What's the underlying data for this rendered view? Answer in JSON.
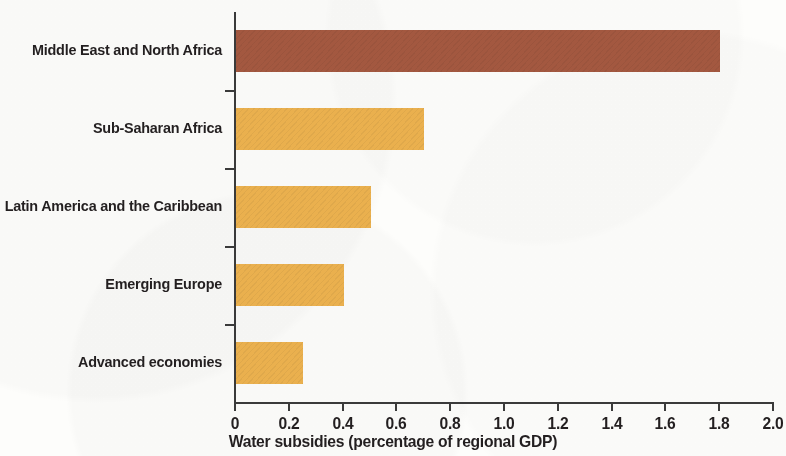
{
  "chart_data": {
    "type": "bar",
    "orientation": "horizontal",
    "title": "",
    "subtitle": "",
    "xlabel": "Water subsidies (percentage of regional GDP)",
    "ylabel": "",
    "categories": [
      "Middle East and North Africa",
      "Sub-Saharan Africa",
      "Latin America and the Caribbean",
      "Emerging Europe",
      "Advanced economies"
    ],
    "values": [
      1.8,
      0.7,
      0.5,
      0.4,
      0.25
    ],
    "bar_colors": [
      "#a35840",
      "#eab04e",
      "#eab04e",
      "#eab04e",
      "#eab04e"
    ],
    "xlim": [
      0,
      2.0
    ],
    "xticks": [
      0,
      0.2,
      0.4,
      0.6,
      0.8,
      1.0,
      1.2,
      1.4,
      1.6,
      1.8,
      2.0
    ],
    "xtick_labels": [
      "0",
      "0.2",
      "0.4",
      "0.6",
      "0.8",
      "1.0",
      "1.2",
      "1.4",
      "1.6",
      "1.8",
      "2.0"
    ],
    "grid": false,
    "legend": null,
    "annotations": []
  },
  "axis": {
    "x_title": "Water subsidies (percentage of regional GDP)"
  },
  "colors": {
    "accent_bar": "#a35840",
    "default_bar": "#eab04e",
    "axis": "#3a3a3a",
    "text": "#231f20",
    "background": "#fdfdfb"
  }
}
